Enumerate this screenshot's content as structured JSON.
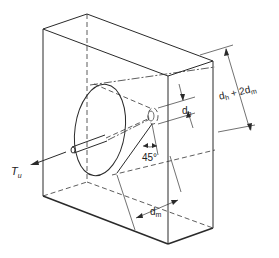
{
  "figure": {
    "type": "diagram",
    "labels": {
      "tension": "T",
      "tension_sub": "u",
      "head_diameter": "d",
      "head_diameter_sub": "h",
      "cone_width_d": "d",
      "cone_width_sub1": "h",
      "cone_width_plus": " + 2d",
      "cone_width_sub2": "m",
      "embedment": "d",
      "embedment_sub": "m",
      "angle": "45°"
    },
    "colors": {
      "line": "#2a2a2a",
      "background": "#ffffff"
    }
  }
}
